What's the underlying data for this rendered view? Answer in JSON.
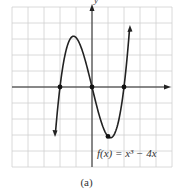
{
  "chart_data": {
    "type": "line",
    "title": "",
    "function_label": "f(x) = x³ − 4x",
    "xlabel": "",
    "ylabel": "y",
    "xlim": [
      -5,
      5
    ],
    "ylim": [
      -5,
      5
    ],
    "grid": true,
    "grid_step": 1,
    "series": [
      {
        "name": "f(x) = x^3 - 4x",
        "x": [
          -2.3,
          -2,
          -1.5,
          -1.155,
          -1,
          -0.5,
          0,
          0.5,
          1,
          1.155,
          1.5,
          2,
          2.35
        ],
        "y": [
          -2.97,
          0,
          2.63,
          3.08,
          3,
          1.88,
          0,
          -1.88,
          -3,
          -3.08,
          -2.63,
          0,
          3.58
        ]
      }
    ],
    "marked_points": [
      {
        "x": -2,
        "y": 0,
        "label": "x-intercept"
      },
      {
        "x": 0,
        "y": 0,
        "label": "x-intercept"
      },
      {
        "x": 2,
        "y": 0,
        "label": "x-intercept"
      },
      {
        "x": 1,
        "y": -3,
        "label": "point"
      }
    ],
    "caption": "(a)"
  },
  "labels": {
    "y_axis": "y",
    "function": "f(x) = x³ − 4x",
    "caption": "(a)"
  },
  "colors": {
    "grid": "#cfcfcf",
    "axis": "#222222",
    "curve": "#222222",
    "text": "#333333"
  }
}
